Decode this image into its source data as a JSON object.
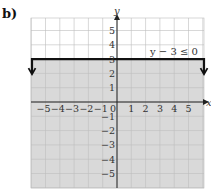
{
  "panel_label": "b)",
  "colors": {
    "shade": "#d9d9d9",
    "grid": "#bdbdbd",
    "axis": "#222222",
    "boundary": "#111111",
    "background": "#ffffff"
  },
  "chart_data": {
    "type": "line",
    "title": "",
    "xlabel": "x",
    "ylabel": "y",
    "xlim": [
      -6,
      6
    ],
    "ylim": [
      -6,
      6
    ],
    "x_ticks": [
      "-5",
      "-4",
      "-3",
      "-2",
      "-1",
      "0",
      "1",
      "2",
      "3",
      "4",
      "5"
    ],
    "y_ticks": [
      "5",
      "4",
      "3",
      "2",
      "1",
      "-1",
      "-2",
      "-3",
      "-4",
      "-5"
    ],
    "grid": true,
    "boundary": {
      "equation": "y = 3",
      "style": "solid",
      "x_range": [
        -6,
        6
      ],
      "end_arrows": "down"
    },
    "shaded_region": "y <= 3",
    "annotation": "y − 3 ≤ 0",
    "legend": null
  }
}
